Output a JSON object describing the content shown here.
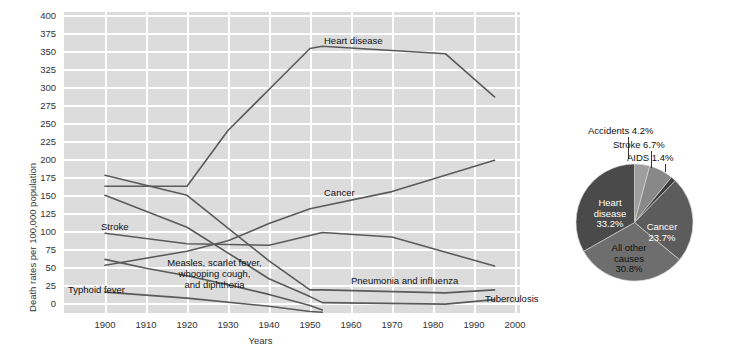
{
  "chart_data": [
    {
      "type": "line",
      "title": "",
      "xlabel": "Years",
      "ylabel": "Death rates per 100,000 population",
      "xlim": [
        1895,
        2005
      ],
      "ylim": [
        0,
        400
      ],
      "grid": true,
      "legend": "inline-annotations",
      "xticks": [
        "1900",
        "1910",
        "1920",
        "1930",
        "1940",
        "1950",
        "1960",
        "1970",
        "1980",
        "1990",
        "2000"
      ],
      "yticks": [
        "0",
        "25",
        "50",
        "75",
        "100",
        "125",
        "150",
        "175",
        "200",
        "225",
        "250",
        "275",
        "300",
        "325",
        "350",
        "375",
        "400"
      ],
      "series": [
        {
          "name": "Heart disease",
          "x": [
            1900,
            1920,
            1930,
            1940,
            1950,
            1953,
            1983,
            1995
          ],
          "values": [
            170,
            170,
            245,
            300,
            355,
            358,
            348,
            290
          ]
        },
        {
          "name": "Cancer",
          "x": [
            1900,
            1920,
            1930,
            1940,
            1950,
            1970,
            1995
          ],
          "values": [
            64,
            83,
            97,
            120,
            140,
            163,
            205
          ]
        },
        {
          "name": "Stroke",
          "x": [
            1900,
            1920,
            1940,
            1950,
            1953,
            1970,
            1995
          ],
          "values": [
            107,
            93,
            91,
            104,
            108,
            102,
            63
          ]
        },
        {
          "name": "Pneumonia and influenza",
          "x": [
            1900,
            1920,
            1940,
            1950,
            1953,
            1983,
            1995
          ],
          "values": [
            185,
            158,
            70,
            31,
            31,
            27,
            31
          ]
        },
        {
          "name": "Tuberculosis",
          "x": [
            1900,
            1920,
            1940,
            1950,
            1953,
            1983,
            1995
          ],
          "values": [
            158,
            115,
            46,
            22,
            14,
            12,
            18
          ]
        },
        {
          "name": "Measles, scarlet fever, whooping cough, and diphtheria",
          "x": [
            1900,
            1910,
            1920,
            1930,
            1940,
            1950,
            1953
          ],
          "values": [
            72,
            60,
            50,
            38,
            25,
            10,
            4
          ]
        },
        {
          "name": "Typhoid fever",
          "x": [
            1900,
            1920,
            1940,
            1950,
            1953
          ],
          "values": [
            28,
            20,
            9,
            2,
            1
          ]
        }
      ],
      "annotations": [
        {
          "label": "Heart disease",
          "x": 1930,
          "y": 375
        },
        {
          "label": "Cancer",
          "x": 1938,
          "y": 178
        },
        {
          "label": "Stroke",
          "x": 1903,
          "y": 122
        },
        {
          "label": "Typhoid fever",
          "x": 1900,
          "y": 47
        },
        {
          "label_line1": "Measles, scarlet fever,",
          "label_line2": "whooping cough,",
          "label_line3": "and diphtheria"
        },
        {
          "label": "Pneumonia and influenza",
          "x": 1955,
          "y": 50
        },
        {
          "label": "Tuberculosis",
          "x": 1982,
          "y": 26
        }
      ]
    },
    {
      "type": "pie",
      "title": "",
      "labels": [
        "Accidents",
        "Stroke",
        "AIDS",
        "Cancer",
        "All other causes",
        "Heart disease"
      ],
      "values": [
        4.2,
        6.7,
        1.4,
        23.7,
        30.8,
        33.2
      ],
      "value_suffix": "%",
      "start_angle_deg": 0,
      "direction": "clockwise",
      "slices": [
        {
          "label": "Accidents",
          "value": "4.2%",
          "display": "Accidents 4.2%",
          "color": "#9e9e9e",
          "placement": "callout"
        },
        {
          "label": "Stroke",
          "value": "6.7%",
          "display": "Stroke 6.7%",
          "color": "#888888",
          "placement": "callout"
        },
        {
          "label": "AIDS",
          "value": "1.4%",
          "display": "AIDS 1.4%",
          "color": "#3f3f3f",
          "placement": "callout"
        },
        {
          "label": "Cancer",
          "value": "23.7%",
          "display": "Cancer\n23.7%",
          "color": "#5c5c5c",
          "placement": "inside"
        },
        {
          "label": "All other causes",
          "value": "30.8%",
          "display": "All other causes 30.8%",
          "color": "#6e6e6e",
          "placement": "inside"
        },
        {
          "label": "Heart disease",
          "value": "33.2%",
          "display": "Heart disease 33.2%",
          "color": "#4a4a4a",
          "placement": "inside"
        }
      ]
    }
  ],
  "axis": {
    "y_title": "Death rates per 100,000 population",
    "x_title": "Years",
    "yticks": [
      "400",
      "375",
      "350",
      "325",
      "300",
      "275",
      "250",
      "225",
      "200",
      "175",
      "150",
      "125",
      "100",
      "75",
      "50",
      "25",
      "0"
    ],
    "xticks": [
      "1900",
      "1910",
      "1920",
      "1930",
      "1940",
      "1950",
      "1960",
      "1970",
      "1980",
      "1990",
      "2000"
    ]
  },
  "line_labels": {
    "heart_disease": "Heart disease",
    "cancer": "Cancer",
    "stroke": "Stroke",
    "typhoid": "Typhoid fever",
    "measles_1": "Measles, scarlet fever,",
    "measles_2": "whooping cough,",
    "measles_3": "and diphtheria",
    "pneumonia": "Pneumonia and influenza",
    "tuberculosis": "Tuberculosis"
  },
  "pie_labels": {
    "heart_1": "Heart",
    "heart_2": "disease",
    "heart_3": "33.2%",
    "cancer_1": "Cancer",
    "cancer_2": "23.7%",
    "other_1": "All other",
    "other_2": "causes",
    "other_3": "30.8%",
    "accidents": "Accidents 4.2%",
    "stroke": "Stroke 6.7%",
    "aids": "AIDS 1.4%"
  },
  "colors": {
    "plot_bg": "#dcdcdc",
    "gridline": "#ffffff",
    "line": "#5a5a5a",
    "heart_disease_slice": "#4a4a4a",
    "other_causes_slice": "#6e6e6e",
    "cancer_slice": "#5c5c5c",
    "aids_slice": "#3f3f3f",
    "stroke_slice": "#888888",
    "accidents_slice": "#9e9e9e"
  }
}
